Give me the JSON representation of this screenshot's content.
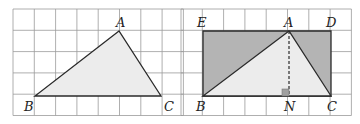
{
  "figures": [
    {
      "name": "triangle-abc",
      "grid": {
        "x0": 13,
        "y0": 9,
        "cols": 8,
        "rows": 5,
        "cell": 21.3
      },
      "points": {
        "A": {
          "label": "A",
          "x": 119,
          "y": 31,
          "lx": 116,
          "ly": 27
        },
        "B": {
          "label": "B",
          "x": 35,
          "y": 96,
          "lx": 24,
          "ly": 111
        },
        "C": {
          "label": "C",
          "x": 161,
          "y": 96,
          "lx": 164,
          "ly": 111
        }
      },
      "fill": "#ececec"
    },
    {
      "name": "triangle-in-rectangle",
      "grid": {
        "x0": 181,
        "y0": 9,
        "cols": 8,
        "rows": 5,
        "cell": 21.3
      },
      "points": {
        "E": {
          "label": "E",
          "x": 203,
          "y": 31,
          "lx": 197,
          "ly": 27
        },
        "A": {
          "label": "A",
          "x": 289,
          "y": 31,
          "lx": 284,
          "ly": 27
        },
        "D": {
          "label": "D",
          "x": 331,
          "y": 31,
          "lx": 326,
          "ly": 27
        },
        "B": {
          "label": "B",
          "x": 203,
          "y": 96,
          "lx": 196,
          "ly": 111
        },
        "N": {
          "label": "N",
          "x": 289,
          "y": 96,
          "lx": 284,
          "ly": 111
        },
        "C": {
          "label": "C",
          "x": 331,
          "y": 96,
          "lx": 327,
          "ly": 111
        }
      },
      "rect_fill": "#b4b4b4",
      "triangle_fill": "#ececec"
    }
  ],
  "colors": {
    "grid": "#9a9a9a",
    "line": "#2a2a2a"
  }
}
